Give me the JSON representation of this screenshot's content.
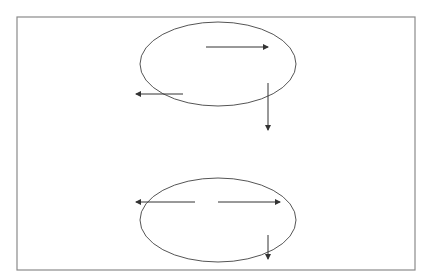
{
  "diagram": {
    "type": "vector-field-schematic",
    "colors": {
      "background": "#ffffff",
      "frame": "#8a8a8a",
      "ellipse": "#555555",
      "arrow": "#333333"
    },
    "frame": {
      "x": 17,
      "y": 17,
      "width": 398,
      "height": 253
    },
    "panels": [
      {
        "name": "top",
        "ellipse": {
          "cx": 218,
          "cy": 64,
          "rx": 78,
          "ry": 42
        },
        "arrows": [
          {
            "name": "arrow-right",
            "x1": 206,
            "y1": 47,
            "x2": 268,
            "y2": 47
          },
          {
            "name": "arrow-left",
            "x1": 183,
            "y1": 94,
            "x2": 136,
            "y2": 94
          },
          {
            "name": "arrow-down",
            "x1": 268,
            "y1": 83,
            "x2": 268,
            "y2": 130
          }
        ]
      },
      {
        "name": "bottom",
        "ellipse": {
          "cx": 218,
          "cy": 220,
          "rx": 78,
          "ry": 42
        },
        "arrows": [
          {
            "name": "arrow-left",
            "x1": 195,
            "y1": 202,
            "x2": 136,
            "y2": 202
          },
          {
            "name": "arrow-right",
            "x1": 218,
            "y1": 202,
            "x2": 280,
            "y2": 202
          },
          {
            "name": "arrow-down",
            "x1": 268,
            "y1": 235,
            "x2": 268,
            "y2": 259
          }
        ]
      }
    ]
  }
}
